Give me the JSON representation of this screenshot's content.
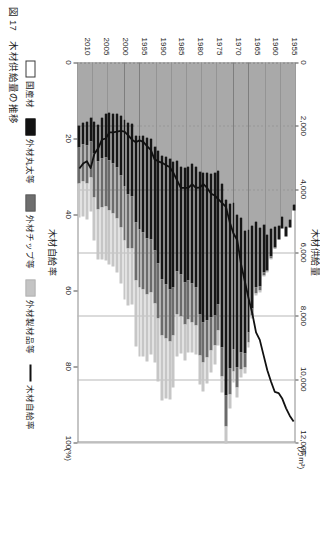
{
  "caption": {
    "number": "図 17",
    "title": "木材供給量の推移"
  },
  "legend": {
    "position": "bottom",
    "items": [
      {
        "label": "国産材",
        "swatch": "white-square-swatch",
        "color": "#ffffff"
      },
      {
        "label": "外材丸太等",
        "swatch": "black-square-swatch",
        "color": "#161616"
      },
      {
        "label": "外材チップ等",
        "swatch": "dark-gray-square-swatch",
        "color": "#6b6b6b"
      },
      {
        "label": "外材製材品等",
        "swatch": "light-gray-square-swatch",
        "color": "#c6c6c6"
      },
      {
        "label": "木材自給率",
        "swatch": "line-swatch",
        "color": "#111111"
      }
    ]
  },
  "axes": {
    "left_title": "木材供給量",
    "left_unit": "(万m³)",
    "right_title": "木材自給率",
    "right_unit": "(%)",
    "left_ticks": [
      "0",
      "2,000",
      "4,000",
      "6,000",
      "8,000",
      "10,000",
      "12,000"
    ],
    "right_ticks": [
      "0",
      "20",
      "40",
      "60",
      "80",
      "100"
    ],
    "year_ticks": [
      "1955",
      "1960",
      "1965",
      "1970",
      "1975",
      "1980",
      "1985",
      "1990",
      "1995",
      "2000",
      "2005",
      "2010"
    ]
  },
  "chart_data": {
    "type": "bar",
    "orientation": "vertical-stacked-with-line-overlay",
    "title": "木材供給量の推移",
    "xlabel": "",
    "ylabel": "木材供給量 (万m³)",
    "y2label": "木材自給率 (%)",
    "ylim": [
      0,
      12000
    ],
    "y2lim": [
      0,
      100
    ],
    "grid": true,
    "categories": [
      1955,
      1956,
      1957,
      1958,
      1959,
      1960,
      1961,
      1962,
      1963,
      1964,
      1965,
      1966,
      1967,
      1968,
      1969,
      1970,
      1971,
      1972,
      1973,
      1974,
      1975,
      1976,
      1977,
      1978,
      1979,
      1980,
      1981,
      1982,
      1983,
      1984,
      1985,
      1986,
      1987,
      1988,
      1989,
      1990,
      1991,
      1992,
      1993,
      1994,
      1995,
      1996,
      1997,
      1998,
      1999,
      2000,
      2001,
      2002,
      2003,
      2004,
      2005,
      2006,
      2007,
      2008,
      2009,
      2010,
      2011,
      2012
    ],
    "series": [
      {
        "name": "国産材",
        "color": "#ffffff",
        "values": [
          4474,
          4954,
          5177,
          4851,
          5132,
          5176,
          5234,
          5446,
          5107,
          5200,
          5026,
          5137,
          5274,
          5303,
          4887,
          4790,
          4423,
          4449,
          4325,
          3823,
          3405,
          3462,
          3504,
          3470,
          3462,
          3435,
          3278,
          3200,
          3284,
          3326,
          3272,
          3088,
          3135,
          3046,
          2975,
          2922,
          2786,
          2655,
          2403,
          2370,
          2291,
          2300,
          2317,
          1920,
          1900,
          1800,
          1670,
          1620,
          1600,
          1570,
          1608,
          1750,
          1950,
          1870,
          1750,
          1850,
          1880,
          2000
        ]
      },
      {
        "name": "外材丸太等",
        "color": "#161616",
        "values": [
          200,
          260,
          330,
          390,
          470,
          670,
          900,
          1110,
          1530,
          1880,
          2080,
          2620,
          3250,
          3890,
          4280,
          4830,
          4630,
          5220,
          6180,
          5190,
          4230,
          4520,
          4550,
          4670,
          4760,
          4530,
          3830,
          3780,
          3590,
          3630,
          3410,
          3500,
          3980,
          4130,
          4030,
          3920,
          3560,
          3270,
          3180,
          3200,
          3080,
          2980,
          2730,
          2300,
          2280,
          2120,
          1890,
          1710,
          1600,
          1520,
          1390,
          1290,
          1180,
          1000,
          760,
          760,
          720,
          700
        ]
      },
      {
        "name": "外材チップ等",
        "color": "#6b6b6b",
        "values": [
          0,
          0,
          0,
          0,
          0,
          20,
          40,
          60,
          90,
          130,
          180,
          240,
          330,
          430,
          530,
          650,
          700,
          820,
          980,
          900,
          820,
          950,
          1050,
          1170,
          1260,
          1280,
          1200,
          1220,
          1250,
          1320,
          1340,
          1380,
          1500,
          1620,
          1700,
          1790,
          1740,
          1690,
          1680,
          1760,
          1790,
          1820,
          1840,
          1640,
          1680,
          1700,
          1640,
          1590,
          1560,
          1580,
          1560,
          1540,
          1520,
          1380,
          1120,
          1200,
          1150,
          1120
        ]
      },
      {
        "name": "外材製材品等",
        "color": "#c6c6c6",
        "values": [
          0,
          0,
          0,
          0,
          0,
          0,
          10,
          20,
          30,
          50,
          70,
          100,
          140,
          190,
          250,
          320,
          360,
          450,
          560,
          520,
          490,
          590,
          680,
          820,
          900,
          930,
          900,
          960,
          1030,
          1120,
          1160,
          1320,
          1650,
          1840,
          1920,
          2050,
          1980,
          1850,
          1950,
          2100,
          2120,
          2180,
          2090,
          1780,
          1830,
          1870,
          1790,
          1720,
          1690,
          1700,
          1680,
          1640,
          1580,
          1380,
          1070,
          1160,
          1120,
          1090
        ]
      }
    ],
    "line_series": {
      "name": "木材自給率",
      "unit": "%",
      "color": "#111111",
      "values": [
        94.5,
        93.0,
        91.0,
        88.5,
        87.0,
        86.7,
        84.0,
        81.0,
        77.0,
        73.0,
        71.0,
        66.0,
        62.0,
        57.5,
        53.0,
        46.7,
        45.0,
        42.0,
        38.0,
        37.0,
        36.0,
        35.0,
        34.5,
        33.0,
        32.0,
        32.9,
        33.0,
        32.0,
        33.0,
        33.0,
        33.0,
        31.0,
        29.0,
        27.5,
        27.0,
        26.4,
        26.0,
        25.5,
        23.0,
        22.0,
        20.9,
        20.5,
        21.0,
        20.3,
        19.2,
        18.2,
        18.0,
        18.2,
        18.4,
        18.4,
        20.0,
        20.3,
        22.6,
        24.0,
        27.8,
        26.0,
        26.6,
        27.9
      ]
    }
  }
}
